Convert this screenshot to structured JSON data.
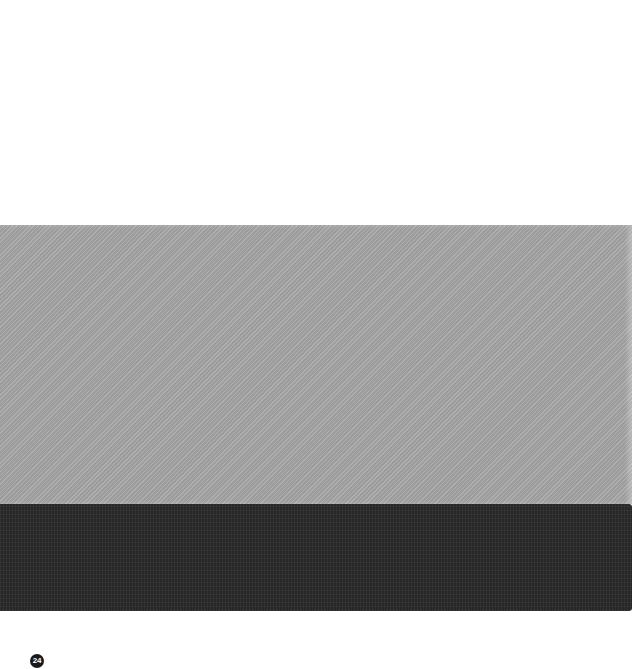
{
  "page": {
    "background": "#ffffff",
    "page_number": "24"
  },
  "swatches": [
    {
      "name": "light-gray-fabric",
      "color": "#a6a6a6"
    },
    {
      "name": "charcoal-fabric",
      "color": "#2b2b2b"
    }
  ]
}
